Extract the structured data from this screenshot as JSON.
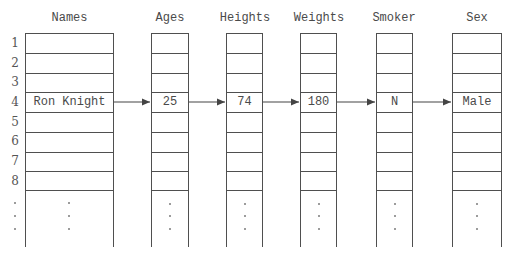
{
  "diagram": {
    "row_numbers": [
      "1",
      "2",
      "3",
      "4",
      "5",
      "6",
      "7",
      "8"
    ],
    "ellipsis_dots": [
      ".",
      ".",
      "."
    ],
    "highlighted_row_index": 4,
    "columns": [
      {
        "header": "Names",
        "value": "Ron Knight"
      },
      {
        "header": "Ages",
        "value": "25"
      },
      {
        "header": "Heights",
        "value": "74"
      },
      {
        "header": "Weights",
        "value": "180"
      },
      {
        "header": "Smoker",
        "value": "N"
      },
      {
        "header": "Sex",
        "value": "Male"
      }
    ],
    "colors": {
      "line": "#4f4f4f",
      "text": "#4a4a4a",
      "background": "#ffffff"
    }
  }
}
